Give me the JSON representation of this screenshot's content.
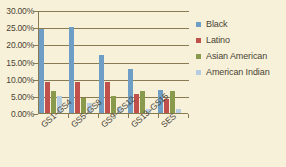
{
  "chart_data": {
    "type": "bar",
    "title": "",
    "subtitle": "",
    "xlabel": "",
    "ylabel": "",
    "categories": [
      "GS1–GS4",
      "GS5–GS8",
      "GS9–GS12",
      "GS13–GS15",
      "SES"
    ],
    "series": [
      {
        "name": "Black",
        "color": "#6e9dc6",
        "values": [
          24.8,
          25.4,
          17.0,
          12.8,
          6.8
        ]
      },
      {
        "name": "Latino",
        "color": "#bf504c",
        "values": [
          9.2,
          9.2,
          9.1,
          5.6,
          4.1
        ]
      },
      {
        "name": "Asian American",
        "color": "#8a9a4c",
        "values": [
          6.4,
          4.5,
          5.1,
          6.4,
          6.5
        ]
      },
      {
        "name": "American Indian",
        "color": "#b6cde1",
        "values": [
          5.0,
          3.0,
          1.7,
          1.2,
          1.1
        ]
      }
    ],
    "ylim": [
      0,
      30
    ],
    "ytick_values": [
      0,
      5,
      10,
      15,
      20,
      25,
      30
    ],
    "ytick_labels": [
      "0.00%",
      "5.00%",
      "10.00%",
      "15.00%",
      "20.00%",
      "25.00%",
      "30.00%"
    ],
    "grid": true,
    "legend_position": "right",
    "background_color": "#f7f1da",
    "axis_color": "#8a7a52",
    "text_color": "#4a4333"
  }
}
